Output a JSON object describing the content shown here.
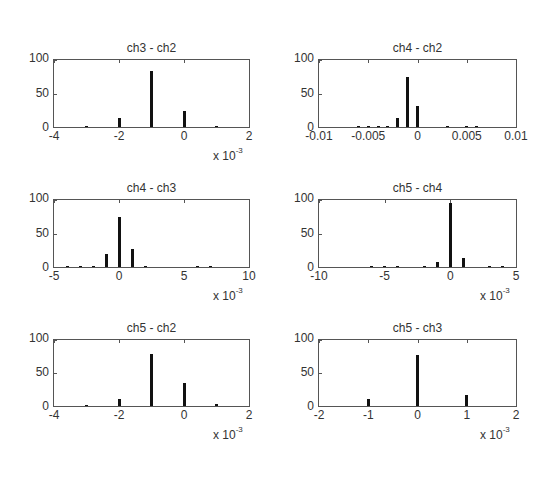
{
  "figure": {
    "background": "#ffffff",
    "bar_color": "#111111",
    "axes_color": "#555555"
  },
  "chart_data": [
    {
      "type": "bar",
      "title": "ch3 - ch2",
      "xlim": [
        -0.004,
        0.002
      ],
      "ylim": [
        0,
        100
      ],
      "xticks": [
        -4,
        -2,
        0,
        2
      ],
      "xtick_labels": [
        "-4",
        "-2",
        "0",
        "2"
      ],
      "yticks": [
        0,
        50,
        100
      ],
      "ytick_labels": [
        "0",
        "50",
        "100"
      ],
      "x_multiplier": "x 10",
      "x_exponent": "-3",
      "x": [
        -0.003,
        -0.002,
        -0.001,
        0.0,
        0.001
      ],
      "values": [
        2,
        14,
        84,
        24,
        2
      ]
    },
    {
      "type": "bar",
      "title": "ch4 - ch2",
      "xlim": [
        -0.01,
        0.01
      ],
      "ylim": [
        0,
        100
      ],
      "xticks": [
        -0.01,
        -0.005,
        0,
        0.005,
        0.01
      ],
      "xtick_labels": [
        "-0.01",
        "-0.005",
        "0",
        "0.005",
        "0.01"
      ],
      "yticks": [
        0,
        50,
        100
      ],
      "ytick_labels": [
        "0",
        "50",
        "100"
      ],
      "x_multiplier": "",
      "x_exponent": "",
      "x": [
        -0.006,
        -0.005,
        -0.004,
        -0.003,
        -0.002,
        -0.001,
        0.0,
        0.003,
        0.005,
        0.006
      ],
      "values": [
        1,
        1,
        1,
        1,
        14,
        74,
        31,
        2,
        1,
        1
      ]
    },
    {
      "type": "bar",
      "title": "ch4 - ch3",
      "xlim": [
        -0.005,
        0.01
      ],
      "ylim": [
        0,
        100
      ],
      "xticks": [
        -5,
        0,
        5,
        10
      ],
      "xtick_labels": [
        "-5",
        "0",
        "5",
        "10"
      ],
      "yticks": [
        0,
        50,
        100
      ],
      "ytick_labels": [
        "0",
        "50",
        "100"
      ],
      "x_multiplier": "x 10",
      "x_exponent": "-3",
      "x": [
        -0.004,
        -0.003,
        -0.002,
        -0.001,
        0.0,
        0.001,
        0.002,
        0.006,
        0.007
      ],
      "values": [
        1,
        1,
        1,
        20,
        75,
        27,
        1,
        1,
        1
      ]
    },
    {
      "type": "bar",
      "title": "ch5 - ch4",
      "xlim": [
        -0.01,
        0.005
      ],
      "ylim": [
        0,
        100
      ],
      "xticks": [
        -10,
        -5,
        0,
        5
      ],
      "xtick_labels": [
        "-10",
        "-5",
        "0",
        "5"
      ],
      "yticks": [
        0,
        50,
        100
      ],
      "ytick_labels": [
        "0",
        "50",
        "100"
      ],
      "x_multiplier": "x 10",
      "x_exponent": "-3",
      "x": [
        -0.006,
        -0.005,
        -0.004,
        -0.002,
        -0.001,
        0.0,
        0.001,
        0.003,
        0.004
      ],
      "values": [
        1,
        1,
        2,
        1,
        8,
        95,
        13,
        1,
        1
      ]
    },
    {
      "type": "bar",
      "title": "ch5 - ch2",
      "xlim": [
        -0.004,
        0.002
      ],
      "ylim": [
        0,
        100
      ],
      "xticks": [
        -4,
        -2,
        0,
        2
      ],
      "xtick_labels": [
        "-4",
        "-2",
        "0",
        "2"
      ],
      "yticks": [
        0,
        50,
        100
      ],
      "ytick_labels": [
        "0",
        "50",
        "100"
      ],
      "x_multiplier": "x 10",
      "x_exponent": "-3",
      "x": [
        -0.003,
        -0.002,
        -0.001,
        0.0,
        0.001
      ],
      "values": [
        1,
        10,
        79,
        35,
        3
      ]
    },
    {
      "type": "bar",
      "title": "ch5 - ch3",
      "xlim": [
        -0.002,
        0.002
      ],
      "ylim": [
        0,
        100
      ],
      "xticks": [
        -2,
        -1,
        0,
        1,
        2
      ],
      "xtick_labels": [
        "-2",
        "-1",
        "0",
        "1",
        "2"
      ],
      "yticks": [
        0,
        50,
        100
      ],
      "ytick_labels": [
        "0",
        "50",
        "100"
      ],
      "x_multiplier": "x 10",
      "x_exponent": "-3",
      "x": [
        -0.001,
        0.0,
        0.001
      ],
      "values": [
        10,
        77,
        16
      ]
    }
  ]
}
